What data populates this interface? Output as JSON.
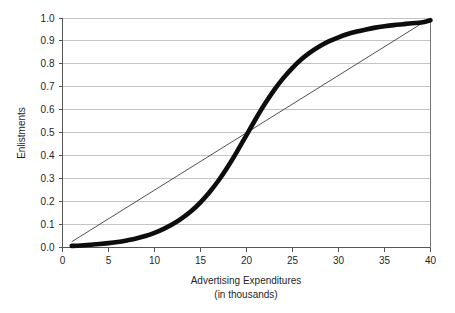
{
  "chart_data": {
    "type": "line",
    "title": "",
    "xlabel": "Advertising Expenditures",
    "xlabel_line2": "(in thousands)",
    "ylabel": "Enlistments",
    "xlim": [
      0,
      40
    ],
    "ylim": [
      0.0,
      1.0
    ],
    "grid": "horizontal",
    "legend": "none",
    "xticks": [
      0,
      5,
      10,
      15,
      20,
      25,
      30,
      35,
      40
    ],
    "xtick_labels": [
      "0",
      "5",
      "10",
      "15",
      "20",
      "25",
      "30",
      "35",
      "40"
    ],
    "yticks": [
      0.0,
      0.1,
      0.2,
      0.3,
      0.4,
      0.5,
      0.6,
      0.7,
      0.8,
      0.9,
      1.0
    ],
    "ytick_labels": [
      "0.0",
      "0.1",
      "0.2",
      "0.3",
      "0.4",
      "0.5",
      "0.6",
      "0.7",
      "0.8",
      "0.9",
      "1.0"
    ],
    "series": [
      {
        "name": "sigmoid-response-curve",
        "style": "thick-black",
        "color": "#0d0d0d",
        "x": [
          1,
          2,
          3,
          4,
          5,
          6,
          7,
          8,
          9,
          10,
          11,
          12,
          13,
          14,
          15,
          16,
          17,
          18,
          19,
          20,
          21,
          22,
          23,
          24,
          25,
          26,
          27,
          28,
          29,
          30,
          31,
          32,
          33,
          34,
          35,
          36,
          37,
          38,
          39,
          40
        ],
        "values": [
          0.007,
          0.009,
          0.012,
          0.015,
          0.019,
          0.024,
          0.031,
          0.039,
          0.05,
          0.064,
          0.081,
          0.102,
          0.128,
          0.159,
          0.197,
          0.242,
          0.294,
          0.354,
          0.42,
          0.49,
          0.56,
          0.626,
          0.686,
          0.738,
          0.783,
          0.821,
          0.852,
          0.878,
          0.899,
          0.916,
          0.93,
          0.941,
          0.95,
          0.958,
          0.964,
          0.969,
          0.973,
          0.977,
          0.98,
          0.99
        ]
      },
      {
        "name": "linear-reference-line",
        "style": "thin-black",
        "color": "#3c3c3c",
        "x": [
          1,
          40
        ],
        "values": [
          0.025,
          1.0
        ]
      }
    ],
    "annotations": [
      {
        "label": "curves-intersect",
        "x": 20,
        "y": 0.5
      }
    ]
  },
  "axes": {
    "y_axis_title": "Enlistments",
    "x_axis_title": "Advertising Expenditures",
    "x_axis_subtitle": "(in thousands)"
  }
}
